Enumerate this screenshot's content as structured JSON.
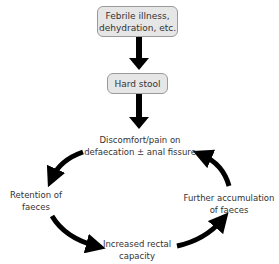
{
  "diagram": {
    "nodes": {
      "febrile": {
        "line1": "Febrile illness,",
        "line2": "dehydration, etc."
      },
      "hard_stool": {
        "label": "Hard stool"
      },
      "discomfort": {
        "line1": "Discomfort/pain on",
        "line2": "defaecation ± anal fissure"
      },
      "retention": {
        "line1": "Retention of",
        "line2": "faeces"
      },
      "rectal": {
        "line1": "Increased rectal",
        "line2": "capacity"
      },
      "accumulation": {
        "line1": "Further accumulation",
        "line2": "of faeces"
      }
    },
    "colors": {
      "box_fill": "#e6e6e6",
      "box_border": "#9a9a9a",
      "arrow": "#000000",
      "text": "#333333"
    }
  }
}
